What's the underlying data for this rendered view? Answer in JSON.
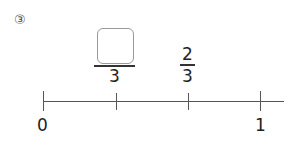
{
  "problem": {
    "number_label": "③"
  },
  "fractions": [
    {
      "numerator": "",
      "denominator": "3",
      "numerator_is_blank": true
    },
    {
      "numerator": "2",
      "denominator": "3",
      "numerator_is_blank": false
    }
  ],
  "number_line": {
    "start_label": "0",
    "end_label": "1",
    "ticks": 4
  }
}
